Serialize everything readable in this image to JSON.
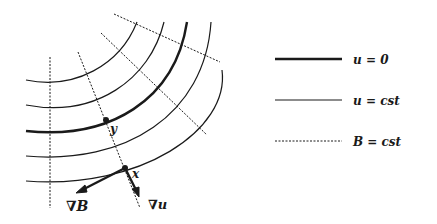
{
  "figure": {
    "point_labels": {
      "y": "y",
      "x": "x"
    },
    "vector_labels": {
      "grad_B": "∇B",
      "grad_u": "∇u"
    }
  },
  "legend": {
    "items": [
      {
        "style": "thick-solid",
        "label": "u = 0"
      },
      {
        "style": "thin-solid",
        "label": "u = cst"
      },
      {
        "style": "dotted",
        "label": "B = cst"
      }
    ]
  },
  "colors": {
    "ink": "#1a1a1a",
    "background": "#ffffff"
  }
}
